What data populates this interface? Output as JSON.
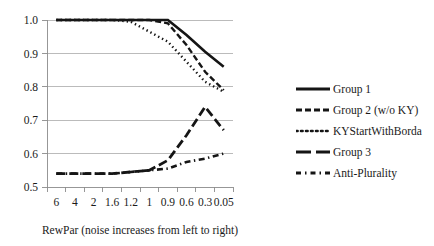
{
  "chart_data": {
    "type": "line",
    "title": "",
    "xlabel": "RewPar (noise increases from left to right)",
    "ylabel": "",
    "categories": [
      "6",
      "4",
      "2",
      "1.6",
      "1.2",
      "1",
      "0.9",
      "0.6",
      "0.3",
      "0.05"
    ],
    "ylim": [
      0.5,
      1.0
    ],
    "yticks": [
      "0.5",
      "0.6",
      "0.7",
      "0.8",
      "0.9",
      "1.0"
    ],
    "grid": true,
    "legend_position": "right",
    "series": [
      {
        "name": "Group 1",
        "style": "solid",
        "values": [
          1.0,
          1.0,
          1.0,
          1.0,
          1.0,
          1.0,
          1.0,
          0.955,
          0.905,
          0.86
        ]
      },
      {
        "name": "Group 2 (w/o KY)",
        "style": "dashed",
        "values": [
          1.0,
          1.0,
          1.0,
          1.0,
          1.0,
          1.0,
          0.99,
          0.925,
          0.845,
          0.79
        ]
      },
      {
        "name": "KYStartWithBorda",
        "style": "dotted",
        "values": [
          1.0,
          1.0,
          1.0,
          1.0,
          0.995,
          0.965,
          0.935,
          0.875,
          0.815,
          0.785
        ]
      },
      {
        "name": "Group 3",
        "style": "long-dash",
        "values": [
          0.54,
          0.54,
          0.54,
          0.54,
          0.545,
          0.55,
          0.58,
          0.655,
          0.74,
          0.67
        ]
      },
      {
        "name": "Anti-Plurality",
        "style": "dash-dot",
        "values": [
          0.54,
          0.54,
          0.54,
          0.54,
          0.545,
          0.55,
          0.555,
          0.575,
          0.585,
          0.6
        ]
      }
    ]
  },
  "legend": {
    "items": [
      {
        "label": "Group 1"
      },
      {
        "label": "Group 2 (w/o KY)"
      },
      {
        "label": "KYStartWithBorda"
      },
      {
        "label": "Group 3"
      },
      {
        "label": "Anti-Plurality"
      }
    ]
  },
  "colors": {
    "series": "#151515",
    "grid": "#aaaaaa",
    "axis": "#8c8c8c",
    "text": "#1a1a1a",
    "background": "#ffffff"
  }
}
